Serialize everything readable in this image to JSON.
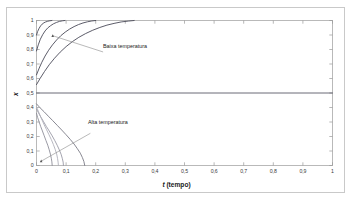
{
  "chart_data": {
    "type": "line",
    "title": "",
    "xlabel": "t (tempo)",
    "xlabel_italic_part": "t",
    "xlabel_rest": " (tempo)",
    "ylabel": "x",
    "xlim": [
      0,
      1
    ],
    "ylim": [
      0,
      1
    ],
    "xticks": [
      "0",
      "0,1",
      "0,2",
      "0,3",
      "0,4",
      "0,5",
      "0,6",
      "0,7",
      "0,8",
      "0,9",
      "1"
    ],
    "yticks": [
      "0",
      "0,1",
      "0,2",
      "0,3",
      "0,4",
      "0,5",
      "0,6",
      "0,7",
      "0,8",
      "0,9",
      "1"
    ],
    "grid": false,
    "legend": "none",
    "annotations": [
      {
        "text": "Baixa temperatura",
        "x": 0.235,
        "y": 0.79,
        "leader_from_x": 0.225,
        "leader_from_y": 0.783,
        "leader_to_x": 0.055,
        "leader_to_y": 0.895
      },
      {
        "text": "Alta temperatura",
        "x": 0.188,
        "y": 0.235,
        "leader_from_x": 0.182,
        "leader_from_y": 0.222,
        "leader_to_x": 0.016,
        "leader_to_y": 0.03
      }
    ],
    "series": [
      {
        "name": "equilibrium",
        "group": "steady",
        "color": "#5a5a68",
        "width": 0.9,
        "points": [
          [
            0,
            0.5
          ],
          [
            1,
            0.5
          ]
        ]
      },
      {
        "name": "baixa-1",
        "group": "Baixa temperatura",
        "color": "#4a4a58",
        "width": 0.9,
        "points": [
          [
            0,
            0.9
          ],
          [
            0.004,
            0.925
          ],
          [
            0.009,
            0.947
          ],
          [
            0.014,
            0.963
          ],
          [
            0.019,
            0.975
          ],
          [
            0.025,
            0.984
          ],
          [
            0.031,
            0.99
          ],
          [
            0.038,
            0.995
          ],
          [
            0.045,
            0.998
          ],
          [
            0.052,
            1.0
          ]
        ]
      },
      {
        "name": "baixa-2",
        "group": "Baixa temperatura",
        "color": "#4a4a58",
        "width": 0.9,
        "points": [
          [
            0,
            0.79
          ],
          [
            0.006,
            0.832
          ],
          [
            0.013,
            0.871
          ],
          [
            0.021,
            0.903
          ],
          [
            0.029,
            0.928
          ],
          [
            0.038,
            0.949
          ],
          [
            0.048,
            0.965
          ],
          [
            0.058,
            0.978
          ],
          [
            0.068,
            0.987
          ],
          [
            0.078,
            0.994
          ],
          [
            0.088,
            0.998
          ],
          [
            0.096,
            1.0
          ]
        ]
      },
      {
        "name": "baixa-3",
        "group": "Baixa temperatura",
        "color": "#4a4a58",
        "width": 0.9,
        "points": [
          [
            0,
            0.625
          ],
          [
            0.008,
            0.666
          ],
          [
            0.018,
            0.712
          ],
          [
            0.029,
            0.755
          ],
          [
            0.041,
            0.795
          ],
          [
            0.054,
            0.832
          ],
          [
            0.068,
            0.866
          ],
          [
            0.082,
            0.895
          ],
          [
            0.097,
            0.92
          ],
          [
            0.112,
            0.941
          ],
          [
            0.127,
            0.958
          ],
          [
            0.142,
            0.972
          ],
          [
            0.157,
            0.983
          ],
          [
            0.172,
            0.991
          ],
          [
            0.187,
            0.997
          ],
          [
            0.2,
            1.0
          ]
        ]
      },
      {
        "name": "baixa-4",
        "group": "Baixa temperatura",
        "color": "#4a4a58",
        "width": 0.9,
        "points": [
          [
            0,
            0.558
          ],
          [
            0.012,
            0.6
          ],
          [
            0.027,
            0.648
          ],
          [
            0.043,
            0.695
          ],
          [
            0.061,
            0.74
          ],
          [
            0.08,
            0.782
          ],
          [
            0.1,
            0.82
          ],
          [
            0.121,
            0.854
          ],
          [
            0.143,
            0.884
          ],
          [
            0.166,
            0.91
          ],
          [
            0.19,
            0.933
          ],
          [
            0.214,
            0.952
          ],
          [
            0.238,
            0.968
          ],
          [
            0.262,
            0.98
          ],
          [
            0.286,
            0.99
          ],
          [
            0.31,
            0.996
          ],
          [
            0.33,
            1.0
          ]
        ]
      },
      {
        "name": "alta-1",
        "group": "Alta temperatura",
        "color": "#8e8e9a",
        "width": 0.9,
        "points": [
          [
            0,
            0.36
          ],
          [
            0.004,
            0.33
          ],
          [
            0.009,
            0.3
          ],
          [
            0.014,
            0.27
          ],
          [
            0.02,
            0.238
          ],
          [
            0.026,
            0.205
          ],
          [
            0.032,
            0.172
          ],
          [
            0.038,
            0.14
          ],
          [
            0.043,
            0.108
          ],
          [
            0.047,
            0.078
          ],
          [
            0.05,
            0.05
          ],
          [
            0.052,
            0.025
          ],
          [
            0.053,
            0.0
          ]
        ]
      },
      {
        "name": "alta-2",
        "group": "Alta temperatura",
        "color": "#9a9aa6",
        "width": 0.9,
        "points": [
          [
            0,
            0.39
          ],
          [
            0.007,
            0.362
          ],
          [
            0.015,
            0.333
          ],
          [
            0.024,
            0.302
          ],
          [
            0.033,
            0.27
          ],
          [
            0.043,
            0.238
          ],
          [
            0.053,
            0.204
          ],
          [
            0.062,
            0.171
          ],
          [
            0.07,
            0.139
          ],
          [
            0.077,
            0.108
          ],
          [
            0.083,
            0.078
          ],
          [
            0.087,
            0.05
          ],
          [
            0.09,
            0.024
          ],
          [
            0.091,
            0.0
          ]
        ]
      },
      {
        "name": "alta-3",
        "group": "Alta temperatura",
        "color": "#7a7a86",
        "width": 0.9,
        "points": [
          [
            0,
            0.425
          ],
          [
            0.012,
            0.398
          ],
          [
            0.026,
            0.37
          ],
          [
            0.04,
            0.34
          ],
          [
            0.055,
            0.309
          ],
          [
            0.07,
            0.277
          ],
          [
            0.085,
            0.245
          ],
          [
            0.1,
            0.212
          ],
          [
            0.114,
            0.18
          ],
          [
            0.127,
            0.148
          ],
          [
            0.138,
            0.116
          ],
          [
            0.148,
            0.085
          ],
          [
            0.155,
            0.055
          ],
          [
            0.16,
            0.028
          ],
          [
            0.163,
            0.0
          ]
        ]
      },
      {
        "name": "alta-4",
        "group": "Alta temperatura",
        "color": "#b0b0ba",
        "width": 0.9,
        "points": [
          [
            0,
            0.405
          ],
          [
            0.006,
            0.375
          ],
          [
            0.012,
            0.345
          ],
          [
            0.019,
            0.313
          ],
          [
            0.026,
            0.28
          ],
          [
            0.034,
            0.247
          ],
          [
            0.042,
            0.213
          ],
          [
            0.05,
            0.179
          ],
          [
            0.057,
            0.145
          ],
          [
            0.063,
            0.112
          ],
          [
            0.068,
            0.08
          ],
          [
            0.071,
            0.05
          ],
          [
            0.073,
            0.023
          ],
          [
            0.074,
            0.0
          ]
        ]
      }
    ]
  },
  "axes": {
    "x_title_italic": "t",
    "x_title_rest": " (tempo)",
    "y_title": "x"
  }
}
